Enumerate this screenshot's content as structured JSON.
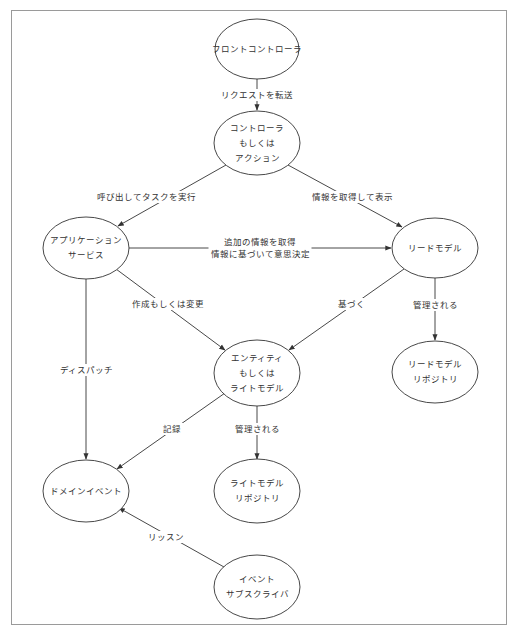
{
  "diagram": {
    "type": "flow",
    "colors": {
      "stroke": "#333333",
      "frame": "#9a9a9a",
      "text": "#333333",
      "background": "#ffffff"
    },
    "nodes": [
      {
        "id": "front_controller",
        "lines": [
          "フロントコントローラ"
        ],
        "cx": 257,
        "cy": 49,
        "rx": 42,
        "ry": 30
      },
      {
        "id": "controller",
        "lines": [
          "コントローラ",
          "もしくは",
          "アクション"
        ],
        "cx": 257,
        "cy": 143,
        "rx": 43,
        "ry": 32
      },
      {
        "id": "app_service",
        "lines": [
          "アプリケーション",
          "サービス"
        ],
        "cx": 86,
        "cy": 248,
        "rx": 43,
        "ry": 31
      },
      {
        "id": "read_model",
        "lines": [
          "リードモデル"
        ],
        "cx": 435,
        "cy": 248,
        "rx": 43,
        "ry": 30
      },
      {
        "id": "entity",
        "lines": [
          "エンティティ",
          "もしくは",
          "ライトモデル"
        ],
        "cx": 257,
        "cy": 373,
        "rx": 43,
        "ry": 33
      },
      {
        "id": "read_model_repo",
        "lines": [
          "リードモデル",
          "リポジトリ"
        ],
        "cx": 435,
        "cy": 372,
        "rx": 43,
        "ry": 31
      },
      {
        "id": "domain_event",
        "lines": [
          "ドメインイベント"
        ],
        "cx": 86,
        "cy": 491,
        "rx": 43,
        "ry": 31
      },
      {
        "id": "write_model_repo",
        "lines": [
          "ライトモデル",
          "リポジトリ"
        ],
        "cx": 257,
        "cy": 491,
        "rx": 43,
        "ry": 32
      },
      {
        "id": "event_subscriber",
        "lines": [
          "イベント",
          "サブスクライバ"
        ],
        "cx": 257,
        "cy": 587,
        "rx": 43,
        "ry": 32
      }
    ],
    "edges": [
      {
        "from": "front_controller",
        "to": "controller",
        "x1": 257,
        "y1": 79,
        "x2": 257,
        "y2": 110,
        "label": [
          "リクエストを転送"
        ],
        "lx": 257,
        "ly": 95
      },
      {
        "from": "controller",
        "to": "app_service",
        "x1": 226,
        "y1": 165,
        "x2": 118,
        "y2": 226,
        "label": [
          "呼び出してタスクを実行"
        ],
        "lx": 146,
        "ly": 197
      },
      {
        "from": "controller",
        "to": "read_model",
        "x1": 288,
        "y1": 165,
        "x2": 402,
        "y2": 227,
        "label": [
          "情報を取得して表示"
        ],
        "lx": 352,
        "ly": 197
      },
      {
        "from": "app_service",
        "to": "read_model",
        "x1": 129,
        "y1": 248,
        "x2": 391,
        "y2": 248,
        "label": [
          "追加の情報を取得",
          "情報に基づいて意思決定"
        ],
        "lx": 260,
        "ly": 248
      },
      {
        "from": "app_service",
        "to": "entity",
        "x1": 116,
        "y1": 269,
        "x2": 225,
        "y2": 350,
        "label": [
          "作成もしくは変更"
        ],
        "lx": 168,
        "ly": 304
      },
      {
        "from": "read_model",
        "to": "entity",
        "x1": 404,
        "y1": 269,
        "x2": 289,
        "y2": 350,
        "label": [
          "基づく"
        ],
        "lx": 351,
        "ly": 304
      },
      {
        "from": "read_model",
        "to": "read_model_repo",
        "x1": 435,
        "y1": 278,
        "x2": 435,
        "y2": 340,
        "label": [
          "管理される"
        ],
        "lx": 435,
        "ly": 305
      },
      {
        "from": "app_service",
        "to": "domain_event",
        "x1": 86,
        "y1": 279,
        "x2": 86,
        "y2": 459,
        "label": [
          "ディスパッチ"
        ],
        "lx": 86,
        "ly": 370
      },
      {
        "from": "entity",
        "to": "domain_event",
        "x1": 225,
        "y1": 393,
        "x2": 117,
        "y2": 469,
        "label": [
          "記録"
        ],
        "lx": 172,
        "ly": 429
      },
      {
        "from": "entity",
        "to": "write_model_repo",
        "x1": 257,
        "y1": 406,
        "x2": 257,
        "y2": 459,
        "label": [
          "管理される"
        ],
        "lx": 257,
        "ly": 429
      },
      {
        "from": "event_subscriber",
        "to": "domain_event",
        "x1": 224,
        "y1": 567,
        "x2": 119,
        "y2": 508,
        "label": [
          "リッスン"
        ],
        "lx": 166,
        "ly": 537
      }
    ]
  }
}
